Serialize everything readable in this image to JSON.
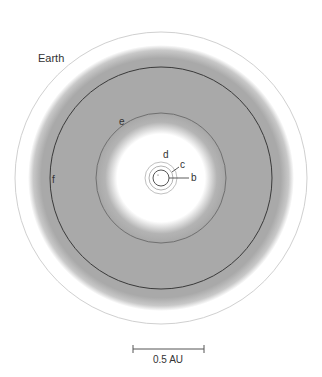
{
  "diagram": {
    "center": {
      "x": 161,
      "y": 178
    },
    "habitable_zone": {
      "color": "#a8a8a8",
      "inner_radius": 50,
      "outer_radius": 131
    },
    "earth_orbit": {
      "label": "Earth",
      "radius": 146,
      "color": "#cfcfcf"
    },
    "orbits": [
      {
        "name": "b",
        "label": "b",
        "radius": 8,
        "color": "#555555"
      },
      {
        "name": "c",
        "label": "c",
        "radius": 12,
        "color": "#9a9a9a"
      },
      {
        "name": "d",
        "label": "d",
        "radius": 16,
        "color": "#b0b0b0"
      },
      {
        "name": "e",
        "label": "e",
        "radius": 65,
        "color": "#707070"
      },
      {
        "name": "f",
        "label": "f",
        "radius": 111,
        "color": "#3a3a3a"
      }
    ],
    "scale_bar": {
      "label": "0.5 AU",
      "x1": 133,
      "x2": 204,
      "y": 349
    }
  }
}
